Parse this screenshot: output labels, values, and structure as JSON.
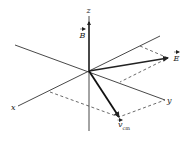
{
  "diagram": {
    "type": "3d-vector-diagram",
    "axes": {
      "x": {
        "label": "x"
      },
      "y": {
        "label": "y"
      },
      "z": {
        "label": "z"
      }
    },
    "vectors": {
      "B": {
        "label": "B",
        "has_arrow_accent": true,
        "direction": "along +z"
      },
      "E": {
        "label": "E",
        "has_arrow_accent": true,
        "direction": "in x-y-ish plane, toward upper right"
      },
      "v_cm": {
        "label": "v",
        "subscript": "cm",
        "has_arrow_accent": true,
        "direction": "toward lower right, in x-y plane"
      }
    },
    "colors": {
      "stroke": "#222222",
      "background": "#ffffff"
    }
  }
}
